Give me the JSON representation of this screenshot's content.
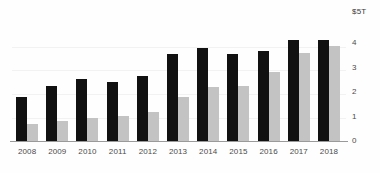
{
  "chart_data": {
    "type": "bar",
    "title": "",
    "subtitle": "",
    "xlabel": "",
    "ylabel": "",
    "unit_label": "$5T",
    "categories": [
      "2008",
      "2009",
      "2010",
      "2011",
      "2012",
      "2013",
      "2014",
      "2015",
      "2016",
      "2017",
      "2018"
    ],
    "series": [
      {
        "name": "dark-series",
        "color": "#111111",
        "values": [
          1.85,
          2.3,
          2.6,
          2.45,
          2.7,
          3.6,
          3.85,
          3.6,
          3.75,
          4.2,
          4.2
        ]
      },
      {
        "name": "light-series",
        "color": "#c3c3c3",
        "values": [
          0.75,
          0.85,
          1.0,
          1.05,
          1.25,
          1.85,
          2.25,
          2.3,
          2.85,
          3.65,
          3.95
        ]
      }
    ],
    "ylim": [
      0,
      5
    ],
    "ytick_values": [
      0,
      1,
      2,
      3,
      4
    ],
    "ytick_labels": [
      "0",
      "1",
      "2",
      "3",
      "4"
    ],
    "grid": true,
    "legend": "none",
    "legend_position": "none"
  },
  "axis": {
    "y_top_label": "$5T",
    "baseline_color": "#9a9a9a"
  }
}
